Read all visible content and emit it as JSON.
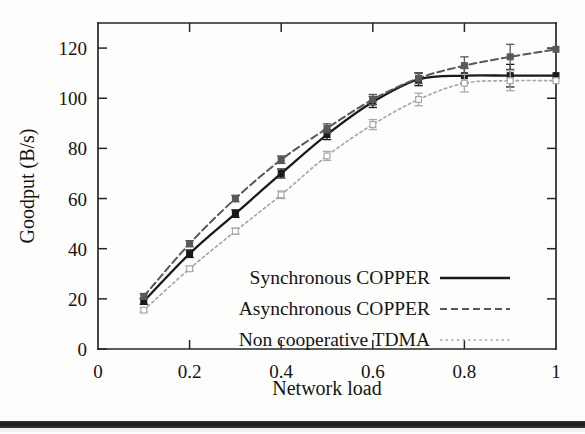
{
  "chart_data": {
    "type": "line",
    "title": "",
    "xlabel": "Network load",
    "ylabel": "Goodput (B/s)",
    "xlim": [
      0,
      1
    ],
    "ylim": [
      0,
      130
    ],
    "xticks": [
      0,
      0.2,
      0.4,
      0.6,
      0.8,
      1
    ],
    "xtick_labels": [
      "0",
      "0.2",
      "0.4",
      "0.6",
      "0.8",
      "1"
    ],
    "yticks": [
      0,
      20,
      40,
      60,
      80,
      100,
      120
    ],
    "ytick_labels": [
      "0",
      "20",
      "40",
      "60",
      "80",
      "100",
      "120"
    ],
    "grid": false,
    "legend_position": "inside lower right",
    "x": [
      0.1,
      0.2,
      0.3,
      0.4,
      0.5,
      0.6,
      0.7,
      0.8,
      0.9,
      1.0
    ],
    "series": [
      {
        "name": "Synchronous COPPER",
        "color": "#1a1a1a",
        "line_style": "solid",
        "marker": "filled-square",
        "values": [
          19,
          38,
          54,
          70,
          85.5,
          98.5,
          107.5,
          109,
          109,
          109
        ],
        "errors": [
          1.2,
          1.5,
          1.5,
          1.8,
          2.0,
          2.2,
          2.5,
          3.0,
          4.5,
          0
        ]
      },
      {
        "name": "Asynchronous COPPER",
        "color": "#585858",
        "line_style": "dashed",
        "marker": "filled-square",
        "values": [
          21,
          42,
          60,
          75.5,
          88,
          99.5,
          108,
          113,
          116.5,
          119.5
        ],
        "errors": [
          1.0,
          1.2,
          1.3,
          1.5,
          1.8,
          2.0,
          2.2,
          3.5,
          5.0,
          0
        ]
      },
      {
        "name": "Non cooperative TDMA",
        "color": "#a8a8a8",
        "line_style": "dotted",
        "marker": "open-square",
        "values": [
          15.5,
          32,
          47,
          61.5,
          77,
          89.5,
          99.5,
          106,
          107,
          107
        ],
        "errors": [
          0.8,
          1.0,
          1.2,
          1.5,
          1.8,
          2.0,
          2.5,
          3.5,
          4.0,
          0
        ]
      }
    ]
  },
  "legend": {
    "entries": [
      {
        "label": "Synchronous COPPER"
      },
      {
        "label": "Asynchronous COPPER"
      },
      {
        "label": "Non cooperative TDMA"
      }
    ]
  },
  "axes": {
    "y_title": "Goodput (B/s)",
    "x_title": "Network load"
  }
}
